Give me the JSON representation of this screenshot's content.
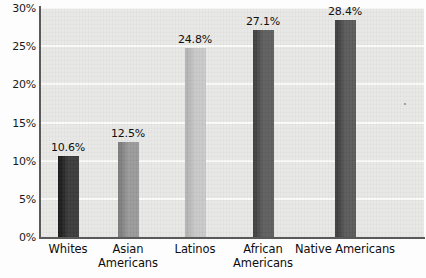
{
  "chart_data": {
    "type": "bar",
    "title": "",
    "subtitle": "",
    "xlabel": "",
    "ylabel": "",
    "categories": [
      "Whites",
      "Asian Americans",
      "Latinos",
      "African Americans",
      "Native Americans"
    ],
    "category_lines": [
      [
        "Whites"
      ],
      [
        "Asian",
        "Americans"
      ],
      [
        "Latinos"
      ],
      [
        "African",
        "Americans"
      ],
      [
        "Native Americans"
      ]
    ],
    "values": [
      10.6,
      12.5,
      24.8,
      27.1,
      28.4
    ],
    "value_labels": [
      "10.6%",
      "12.5%",
      "24.8%",
      "27.1%",
      "28.4%"
    ],
    "bar_colors": [
      "#3a3a3a",
      "#9a9a9a",
      "#c9c9c9",
      "#5e5e5e",
      "#5a5a5a"
    ],
    "bar_colors_dark_edge": [
      "#1c1c1c",
      "#7d7d7d",
      "#b4b4b4",
      "#414141",
      "#3e3e3e"
    ],
    "ylim": [
      0,
      30
    ],
    "yticks": [
      0,
      5,
      10,
      15,
      20,
      25,
      30
    ],
    "ytick_labels": [
      "0%",
      "5%",
      "10%",
      "15%",
      "20%",
      "25%",
      "30%"
    ],
    "grid": true,
    "grid_color": "#fbfbfa",
    "plot_background": "#e8e8e6",
    "axis_color": "#5a5a5a",
    "legend": null,
    "legend_position": "none"
  },
  "layout": {
    "plot_left": 40,
    "plot_top": 8,
    "plot_width": 384,
    "plot_height": 229,
    "bar_width": 21,
    "bar_centers": [
      68,
      128,
      195,
      263,
      345
    ]
  }
}
